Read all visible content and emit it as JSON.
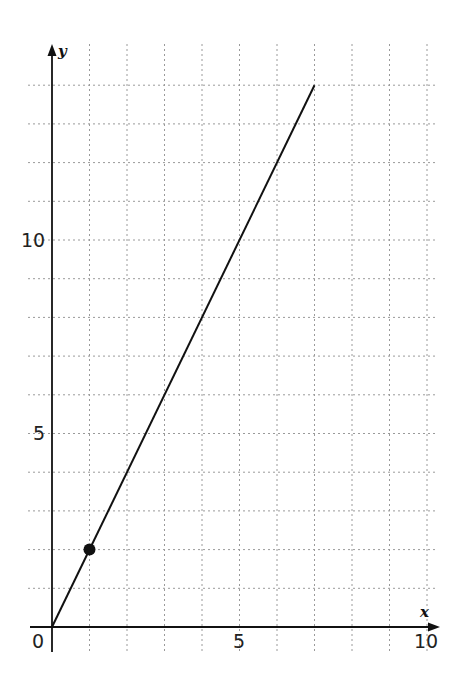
{
  "chart_data": {
    "type": "line",
    "title": "",
    "xlabel": "x",
    "ylabel": "y",
    "xlim": [
      0,
      10
    ],
    "ylim": [
      0,
      14
    ],
    "grid": true,
    "grid_style": "dotted",
    "x_ticks": [
      0,
      1,
      2,
      3,
      4,
      5,
      6,
      7,
      8,
      9,
      10
    ],
    "y_ticks": [
      0,
      1,
      2,
      3,
      4,
      5,
      6,
      7,
      8,
      9,
      10,
      11,
      12,
      13,
      14
    ],
    "x_tick_labels": [
      {
        "value": 5,
        "label": "5"
      },
      {
        "value": 10,
        "label": "10"
      }
    ],
    "y_tick_labels": [
      {
        "value": 5,
        "label": "5"
      },
      {
        "value": 10,
        "label": "10"
      }
    ],
    "origin_label": "0",
    "series": [
      {
        "name": "y = 2x",
        "x": [
          0,
          7
        ],
        "y": [
          0,
          14
        ],
        "color": "#111111"
      }
    ],
    "points": [
      {
        "x": 1,
        "y": 2,
        "marker": "filled-circle",
        "color": "#111111"
      }
    ]
  },
  "labels": {
    "x_axis": "x",
    "y_axis": "y",
    "origin": "0",
    "x_tick_5": "5",
    "x_tick_10": "10",
    "y_tick_5": "5",
    "y_tick_10": "10"
  }
}
